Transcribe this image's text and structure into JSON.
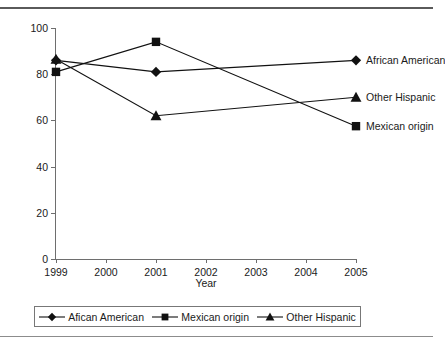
{
  "chart_data": {
    "type": "line",
    "title": "",
    "xlabel": "Year",
    "ylabel": "",
    "xlim": [
      1999,
      2005
    ],
    "ylim": [
      0,
      100
    ],
    "grid": false,
    "x": [
      1999,
      2001,
      2005
    ],
    "xtick_labels": [
      "1999",
      "2000",
      "2001",
      "2002",
      "2003",
      "2004",
      "2005"
    ],
    "xticks": [
      1999,
      2000,
      2001,
      2002,
      2003,
      2004,
      2005
    ],
    "ytick_labels": [
      "0",
      "20",
      "40",
      "60",
      "80",
      "100"
    ],
    "yticks": [
      0,
      20,
      40,
      60,
      80,
      100
    ],
    "legend_position": "below-plot",
    "series": [
      {
        "name": "African American",
        "legend_name": "Afican American",
        "marker": "diamond",
        "values": [
          86,
          81,
          86
        ]
      },
      {
        "name": "Mexican origin",
        "legend_name": "Mexican origin",
        "marker": "square",
        "values": [
          81,
          94,
          57.5
        ]
      },
      {
        "name": "Other Hispanic",
        "legend_name": "Other Hispanic",
        "marker": "triangle",
        "values": [
          86.5,
          62,
          70
        ]
      }
    ],
    "end_labels": [
      {
        "text": "African American",
        "value": 86
      },
      {
        "text": "Other Hispanic",
        "value": 70
      },
      {
        "text": "Mexican origin",
        "value": 57.5
      }
    ],
    "colors": {
      "line": "#111111",
      "axis": "#6e6e6e",
      "text": "#1a1a1a"
    }
  }
}
